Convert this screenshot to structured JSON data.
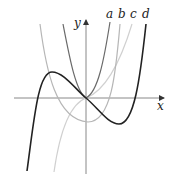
{
  "figure": {
    "axes": {
      "x_label": "x",
      "y_label": "y"
    },
    "curves": [
      {
        "id": "a",
        "label": "a",
        "color": "#6a6a6a",
        "description": "steep curve through origin, rising on both sides"
      },
      {
        "id": "b",
        "label": "b",
        "color": "#b4b4b4",
        "description": "U-shaped curve with minimum below x-axis"
      },
      {
        "id": "c",
        "label": "c",
        "color": "#cfcfcf",
        "description": "S-shaped increasing curve through origin"
      },
      {
        "id": "d",
        "label": "d",
        "color": "#222222",
        "description": "cubic with local max left of origin and local min right of origin"
      }
    ]
  }
}
